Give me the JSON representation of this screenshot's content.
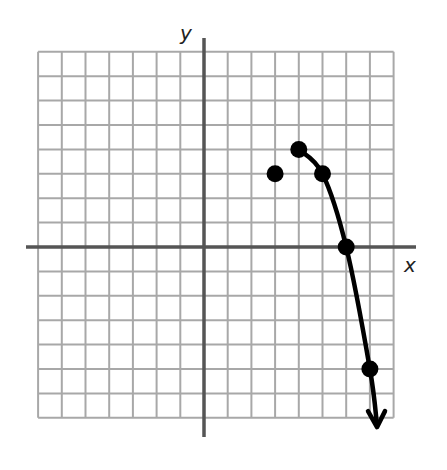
{
  "chart_data": {
    "type": "scatter",
    "title": "",
    "xlabel": "x",
    "ylabel": "y",
    "xlim": [
      -7,
      8
    ],
    "ylim": [
      -7,
      8
    ],
    "grid": true,
    "grid_step": 1,
    "tick_labels": false,
    "legend": null,
    "series": [
      {
        "name": "isolated point",
        "kind": "point",
        "points": [
          [
            3,
            3
          ]
        ]
      },
      {
        "name": "curve",
        "kind": "line-with-points",
        "points": [
          [
            4,
            4
          ],
          [
            5,
            3
          ],
          [
            6,
            0
          ],
          [
            7,
            -5
          ]
        ],
        "continues_with_arrow_to": [
          7.3,
          -7.3
        ]
      }
    ]
  },
  "colors": {
    "grid": "#a8a8a8",
    "axis": "#555555",
    "curve": "#000000",
    "points": "#000000"
  }
}
